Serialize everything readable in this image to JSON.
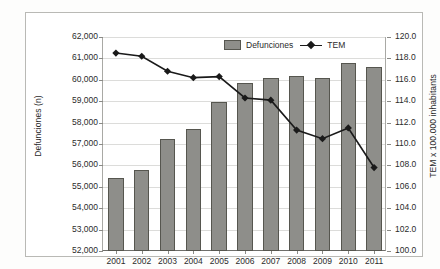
{
  "chart_data": {
    "type": "bar",
    "title": "",
    "subtitle": "",
    "categories": [
      "2001",
      "2002",
      "2003",
      "2004",
      "2005",
      "2006",
      "2007",
      "2008",
      "2009",
      "2010",
      "2011"
    ],
    "xlabel": "",
    "grid": true,
    "legend_position": "top-center",
    "series": [
      {
        "name": "Defunciones",
        "type": "bar",
        "axis": "left",
        "color": "#8e8e8a",
        "values": [
          55400,
          55800,
          57250,
          57700,
          58950,
          59850,
          60100,
          60200,
          60100,
          60800,
          60600
        ]
      },
      {
        "name": "TEM",
        "type": "line",
        "axis": "right",
        "color": "#1a1a1a",
        "marker": "diamond",
        "values": [
          118.5,
          118.2,
          116.8,
          116.2,
          116.3,
          114.3,
          114.1,
          111.3,
          110.5,
          111.5,
          107.8
        ]
      }
    ],
    "left_axis": {
      "label": "Defunciones (n)",
      "ylim": [
        52000,
        62000
      ],
      "tick_step": 1000,
      "ticks": [
        "62,000",
        "61,000",
        "60,000",
        "59,000",
        "58,000",
        "57,000",
        "56,000",
        "55,000",
        "54,000",
        "53,000",
        "52,000"
      ]
    },
    "right_axis": {
      "label": "TEM x 100.000 inhabitants",
      "ylim": [
        100.0,
        120.0
      ],
      "tick_step": 2.0,
      "ticks": [
        "120.0",
        "118.0",
        "116.0",
        "114.0",
        "112.0",
        "110.0",
        "108.0",
        "106.0",
        "104.0",
        "102.0",
        "100.0"
      ]
    }
  },
  "legend": {
    "bars_label": "Defunciones",
    "line_label": "TEM"
  },
  "axes": {
    "left_title": "Defunciones (n)",
    "right_title": "TEM x 100.000 inhabitants"
  }
}
